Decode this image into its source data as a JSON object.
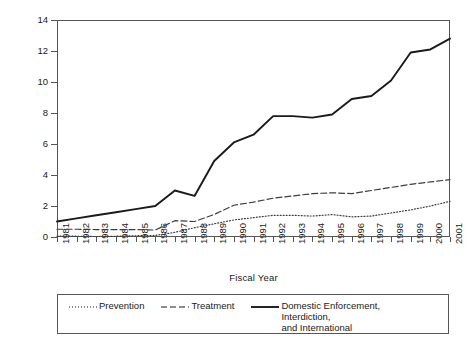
{
  "chart_data": {
    "type": "line",
    "title": "",
    "xlabel": "Fiscal Year",
    "ylabel": "Budget Amount  (in billions)",
    "xlim": [
      1981,
      2001
    ],
    "ylim": [
      0,
      14
    ],
    "yticks": [
      0,
      2,
      4,
      6,
      8,
      10,
      12,
      14
    ],
    "grid": false,
    "legend_position": "bottom",
    "categories": [
      "1981",
      "1982",
      "1983",
      "1984",
      "1985",
      "1986",
      "1987",
      "1988",
      "1989",
      "1990",
      "1991",
      "1992",
      "1993",
      "1994",
      "1995",
      "1996",
      "1997",
      "1998",
      "1999",
      "2000",
      "2001"
    ],
    "series": [
      {
        "name": "Prevention",
        "style": "dotted",
        "color": "#3d3d3d",
        "values": [
          0.05,
          0.05,
          0.03,
          0.05,
          0.08,
          0.1,
          0.3,
          0.6,
          0.85,
          1.1,
          1.25,
          1.4,
          1.4,
          1.35,
          1.45,
          1.3,
          1.35,
          1.55,
          1.75,
          2.0,
          2.3
        ]
      },
      {
        "name": "Treatment",
        "style": "dashed",
        "color": "#3d3d3d",
        "values": [
          0.5,
          0.5,
          0.48,
          0.48,
          0.48,
          0.45,
          1.05,
          1.0,
          1.45,
          2.05,
          2.25,
          2.5,
          2.65,
          2.8,
          2.85,
          2.8,
          3.0,
          3.2,
          3.4,
          3.55,
          3.7
        ]
      },
      {
        "name": "Domestic Enforcement, Interdiction,\nand International",
        "style": "solid",
        "color": "#1a1a1a",
        "values": [
          1.0,
          1.2,
          1.4,
          1.6,
          1.8,
          2.0,
          3.0,
          2.65,
          4.9,
          6.1,
          6.6,
          7.8,
          7.8,
          7.7,
          7.9,
          8.9,
          9.1,
          10.1,
          11.9,
          12.1,
          12.8
        ]
      }
    ]
  },
  "legend": {
    "items": [
      {
        "label": "Prevention",
        "style": "dotted"
      },
      {
        "label": "Treatment",
        "style": "dashed"
      },
      {
        "label": "Domestic Enforcement, Interdiction,\nand International",
        "style": "solid"
      }
    ]
  }
}
